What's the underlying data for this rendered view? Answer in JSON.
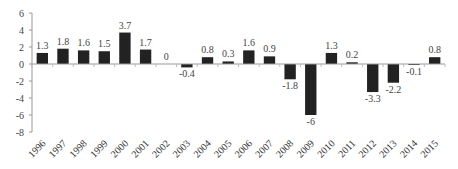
{
  "chart_data": {
    "type": "bar",
    "title": "",
    "xlabel": "",
    "ylabel": "",
    "categories": [
      "1996",
      "1997",
      "1998",
      "1999",
      "2000",
      "2001",
      "2002",
      "2003",
      "2004",
      "2005",
      "2006",
      "2007",
      "2008",
      "2009",
      "2010",
      "2011",
      "2012",
      "2013",
      "2014",
      "2015"
    ],
    "values": [
      1.3,
      1.8,
      1.6,
      1.5,
      3.7,
      1.7,
      0,
      -0.4,
      0.8,
      0.3,
      1.6,
      0.9,
      -1.8,
      -6,
      1.3,
      0.2,
      -3.3,
      -2.2,
      -0.1,
      0.8
    ],
    "data_labels": [
      "1.3",
      "1.8",
      "1.6",
      "1.5",
      "3.7",
      "1.7",
      "0",
      "-0.4",
      "0.8",
      "0.3",
      "1.6",
      "0.9",
      "-1.8",
      "-6",
      "1.3",
      "0.2",
      "-3.3",
      "-2.2",
      "-0.1",
      "0.8"
    ],
    "ylim": [
      -8,
      6
    ],
    "yticks": [
      6,
      4,
      2,
      0,
      -2,
      -4,
      -6,
      -8
    ],
    "grid": false,
    "legend": null,
    "bar_color": "#222222"
  }
}
